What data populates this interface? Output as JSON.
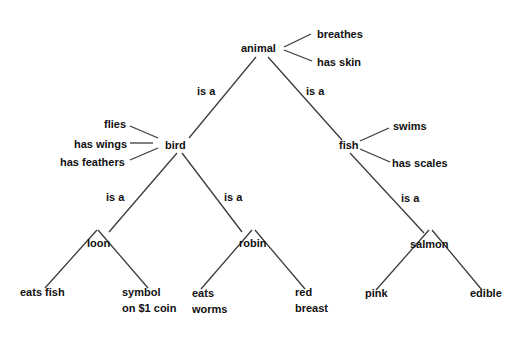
{
  "diagram": {
    "type": "semantic-network",
    "edge_label": "is a",
    "nodes": {
      "animal": "animal",
      "bird": "bird",
      "fish": "fish",
      "loon": "loon",
      "robin": "robin",
      "salmon": "salmon"
    },
    "properties": {
      "animal": [
        "breathes",
        "has skin"
      ],
      "bird": [
        "flies",
        "has wings",
        "has feathers"
      ],
      "fish": [
        "swims",
        "has scales"
      ],
      "loon": [
        "eats fish",
        "symbol\non $1 coin"
      ],
      "robin": [
        "eats\nworms",
        "red\nbreast"
      ],
      "salmon": [
        "pink",
        "edible"
      ]
    },
    "edges": [
      {
        "from": "bird",
        "to": "animal",
        "label": "is a"
      },
      {
        "from": "fish",
        "to": "animal",
        "label": "is a"
      },
      {
        "from": "loon",
        "to": "bird",
        "label": "is a"
      },
      {
        "from": "robin",
        "to": "bird",
        "label": "is a"
      },
      {
        "from": "salmon",
        "to": "fish",
        "label": "is a"
      }
    ],
    "colors": {
      "text": "#111111",
      "line": "#3a3a3a",
      "background": "#ffffff"
    }
  }
}
